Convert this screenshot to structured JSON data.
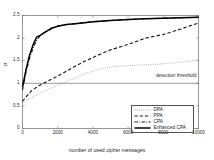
{
  "chart_data": {
    "type": "line",
    "title": "",
    "xlabel": "number of used cipher messages",
    "ylabel": "σ",
    "xlim": [
      0,
      10000
    ],
    "ylim": [
      0,
      2.5
    ],
    "xticks": [
      0,
      2000,
      4000,
      6000,
      8000,
      10000
    ],
    "xtick_labels": [
      "0",
      "2000",
      "4000",
      "6000",
      "8000",
      "10000"
    ],
    "yticks": [
      0,
      0.5,
      1,
      1.5,
      2,
      2.5
    ],
    "ytick_labels": [
      "0",
      "0.5",
      "1",
      "1.5",
      "2",
      "2.5"
    ],
    "grid": false,
    "legend_position": "lower right",
    "annotations": [
      {
        "name": "detection-threshold",
        "text": "detection threshold",
        "y": 1.0,
        "type": "horizontal-line-with-label"
      }
    ],
    "series": [
      {
        "name": "DPA",
        "style": "dotted",
        "color": "#8c8c8c",
        "x": [
          0,
          250,
          500,
          750,
          1000,
          1500,
          2000,
          2500,
          3000,
          3500,
          4000,
          4500,
          5000,
          5500,
          6000,
          6500,
          7000,
          7500,
          8000,
          8500,
          9000,
          9500,
          10000
        ],
        "y": [
          0.56,
          0.62,
          0.68,
          0.73,
          0.78,
          0.87,
          0.95,
          1.04,
          1.12,
          1.2,
          1.27,
          1.32,
          1.36,
          1.38,
          1.39,
          1.4,
          1.41,
          1.42,
          1.43,
          1.45,
          1.47,
          1.49,
          1.52
        ]
      },
      {
        "name": "PPA",
        "style": "dashed",
        "color": "#1a1a1a",
        "x": [
          0,
          250,
          500,
          750,
          1000,
          1500,
          2000,
          2500,
          3000,
          3500,
          4000,
          4500,
          5000,
          5500,
          6000,
          6500,
          7000,
          7500,
          8000,
          8500,
          9000,
          9500,
          10000
        ],
        "y": [
          0.6,
          0.72,
          0.83,
          0.9,
          0.96,
          1.06,
          1.16,
          1.27,
          1.38,
          1.48,
          1.57,
          1.66,
          1.74,
          1.8,
          1.86,
          1.93,
          2.0,
          2.04,
          2.08,
          2.14,
          2.2,
          2.27,
          2.33
        ]
      },
      {
        "name": "CPA",
        "style": "dashdot",
        "color": "#1a1a1a",
        "x": [
          0,
          200,
          400,
          600,
          800,
          1000,
          1250,
          1500,
          1750,
          2000,
          2500,
          3000,
          3500,
          4000,
          5000,
          6000,
          7000,
          8000,
          9000,
          10000
        ],
        "y": [
          0.85,
          1.25,
          1.55,
          1.78,
          1.95,
          2.05,
          2.13,
          2.19,
          2.24,
          2.27,
          2.3,
          2.32,
          2.34,
          2.36,
          2.39,
          2.41,
          2.43,
          2.44,
          2.45,
          2.46
        ]
      },
      {
        "name": "Enhanced CPA",
        "style": "solid",
        "color": "#000000",
        "x": [
          0,
          200,
          400,
          600,
          800,
          1000,
          1250,
          1500,
          1750,
          2000,
          2500,
          3000,
          3500,
          4000,
          5000,
          6000,
          7000,
          8000,
          9000,
          10000
        ],
        "y": [
          0.92,
          1.3,
          1.62,
          1.85,
          2.02,
          2.06,
          2.12,
          2.18,
          2.23,
          2.26,
          2.3,
          2.32,
          2.34,
          2.36,
          2.39,
          2.41,
          2.43,
          2.44,
          2.45,
          2.46
        ]
      }
    ]
  },
  "legend": {
    "items": [
      {
        "label": "DPA",
        "style": "dotted"
      },
      {
        "label": "PPA",
        "style": "dashed"
      },
      {
        "label": "CPA",
        "style": "dashdot"
      },
      {
        "label": "Enhanced CPA",
        "style": "solid"
      }
    ]
  }
}
